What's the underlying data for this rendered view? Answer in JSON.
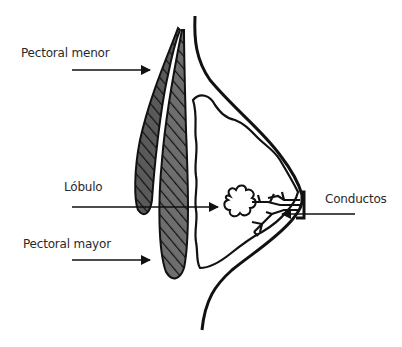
{
  "diagram": {
    "type": "anatomical-cross-section",
    "labels": {
      "pectoral_menor": "Pectoral menor",
      "lobulo": "Lóbulo",
      "pectoral_mayor": "Pectoral mayor",
      "conductos": "Conductos"
    },
    "colors": {
      "ink": "#111111",
      "muscle_dark": "#4a4a4a",
      "muscle_mid": "#6e6e6e",
      "label_text": "#2a2a2a",
      "background": "#ffffff"
    }
  }
}
